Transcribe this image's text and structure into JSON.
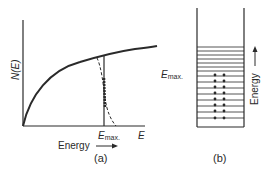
{
  "panel_a": {
    "y_label": "N(E)",
    "x_end_label": "E",
    "emax_label": "E",
    "emax_sub": "max.",
    "energy_label": "Energy",
    "caption": "(a)"
  },
  "panel_b": {
    "emax_label": "E",
    "emax_sub": "max.",
    "energy_label": "Energy",
    "caption": "(b)",
    "empty_levels": 7,
    "occupied_levels": 8,
    "electrons_per_level": 2
  },
  "colors": {
    "ink": "#2a2a2a",
    "background": "#ffffff"
  }
}
